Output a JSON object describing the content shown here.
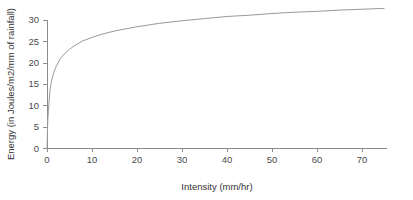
{
  "chart_data": {
    "type": "line",
    "title": "",
    "xlabel": "Intensity (mm/hr)",
    "ylabel": "Energy (in Joules/m2/mm of rainfall)",
    "xlim": [
      0,
      75
    ],
    "ylim": [
      0,
      30
    ],
    "grid": false,
    "legend": "none",
    "xticks": [
      0,
      10,
      20,
      30,
      40,
      50,
      60,
      70
    ],
    "yticks": [
      0,
      5,
      10,
      15,
      20,
      25,
      30
    ],
    "xtick_labels": [
      "0",
      "10",
      "20",
      "30",
      "40",
      "50",
      "60",
      "70"
    ],
    "ytick_labels": [
      "0",
      "5",
      "10",
      "15",
      "20",
      "25",
      "30"
    ],
    "series": [
      {
        "name": "Kinetic energy of rainfall",
        "color": "#9a9a9a",
        "x": [
          0,
          0.05,
          0.1,
          0.2,
          0.3,
          0.5,
          0.7,
          1,
          1.5,
          2,
          3,
          4,
          5,
          6,
          8,
          10,
          12,
          15,
          18,
          20,
          25,
          30,
          35,
          40,
          45,
          50,
          55,
          60,
          65,
          70,
          75
        ],
        "y": [
          0,
          1.2,
          4.1,
          7.0,
          8.5,
          11.4,
          13.9,
          15.6,
          17.7,
          19.0,
          21.0,
          22.2,
          23.1,
          23.9,
          25.1,
          25.9,
          26.6,
          27.4,
          28.0,
          28.4,
          29.2,
          29.8,
          30.3,
          30.8,
          31.1,
          31.5,
          31.8,
          32.0,
          32.3,
          32.5,
          32.7
        ]
      }
    ],
    "plot_geometry": {
      "origin_x_px": 47,
      "origin_y_px": 148,
      "x_px_per_unit": 4.5,
      "y_px_per_unit": 4.27,
      "x_axis_end_px": 387,
      "y_axis_top_px": 20
    }
  },
  "axes": {
    "x_title": "Intensity (mm/hr)",
    "y_title": "Energy (in Joules/m2/mm of rainfall)"
  }
}
